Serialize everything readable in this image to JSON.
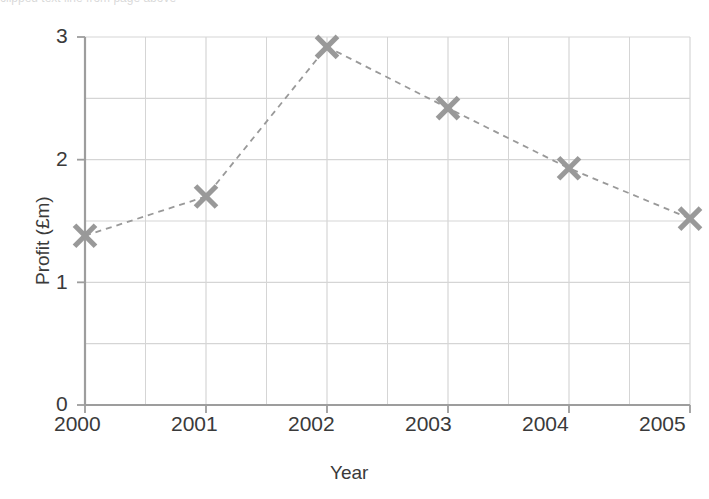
{
  "chart_data": {
    "type": "line",
    "title": "",
    "subtitle": "",
    "xlabel": "Year",
    "ylabel": "Profit (£m)",
    "categories": [
      "2000",
      "2001",
      "2002",
      "2003",
      "2004",
      "2005"
    ],
    "x": [
      2000,
      2001,
      2002,
      2003,
      2004,
      2005
    ],
    "values": [
      1.38,
      1.7,
      2.92,
      2.42,
      1.93,
      1.52
    ],
    "series": [
      {
        "name": "Profit",
        "values": [
          1.38,
          1.7,
          2.92,
          2.42,
          1.93,
          1.52
        ],
        "marker": "x-cross",
        "line_style": "dashed",
        "color": "#999999"
      }
    ],
    "xlim": [
      2000,
      2005
    ],
    "ylim": [
      0,
      3
    ],
    "ytick_labels": [
      "0",
      "1",
      "2",
      "3"
    ],
    "ytick_values": [
      0,
      1,
      2,
      3
    ],
    "y_minor_step": 0.5,
    "xtick_labels": [
      "2000",
      "2001",
      "2002",
      "2003",
      "2004",
      "2005"
    ],
    "x_minor_step": 0.5,
    "grid": true,
    "legend": null,
    "annotations": []
  },
  "style": {
    "marker_color": "#9a9a9a",
    "line_color": "#a8a8a8",
    "grid_color": "#d5d5d5",
    "axis_color": "#9d9d9d",
    "text_color": "#3a3a3a",
    "background": "#ffffff"
  },
  "artifact": {
    "top_text": "clipped text line from page above"
  }
}
